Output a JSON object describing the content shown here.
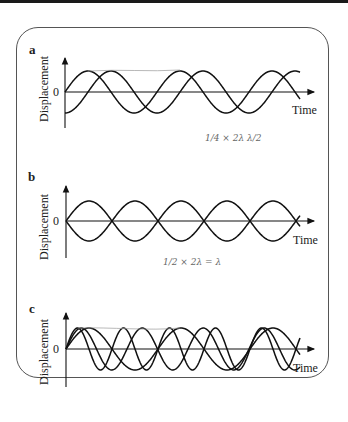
{
  "panels": [
    {
      "id": "a",
      "label": "a",
      "ylabel": "Displacement",
      "zero": "0",
      "xlabel": "Time",
      "note": "1/4 × 2λ   λ/2"
    },
    {
      "id": "b",
      "label": "b",
      "ylabel": "Displacement",
      "zero": "0",
      "xlabel": "Time",
      "note": "1/2 × 2λ = λ"
    },
    {
      "id": "c",
      "label": "c",
      "ylabel": "Displacement",
      "zero": "0",
      "xlabel": "Time",
      "note": ""
    }
  ],
  "chart_data": [
    {
      "type": "line",
      "title": "a",
      "xlabel": "Time",
      "ylabel": "Displacement",
      "series": [
        {
          "name": "wave 1",
          "form": "sin",
          "period": 92,
          "phase": 0
        },
        {
          "name": "wave 2",
          "form": "-cos",
          "period": 92,
          "phase": "quarter period"
        }
      ]
    },
    {
      "type": "line",
      "title": "b",
      "xlabel": "Time",
      "ylabel": "Displacement",
      "series": [
        {
          "name": "wave 1",
          "form": "sin",
          "period": 92,
          "phase": 0
        },
        {
          "name": "wave 2",
          "form": "-sin",
          "period": 92,
          "phase": "half period"
        }
      ]
    },
    {
      "type": "line",
      "title": "c",
      "xlabel": "Time",
      "ylabel": "Displacement",
      "series": [
        {
          "name": "wave 1",
          "form": "sin",
          "period": 92
        },
        {
          "name": "wave 2",
          "form": "sin",
          "period": 61
        }
      ]
    }
  ]
}
